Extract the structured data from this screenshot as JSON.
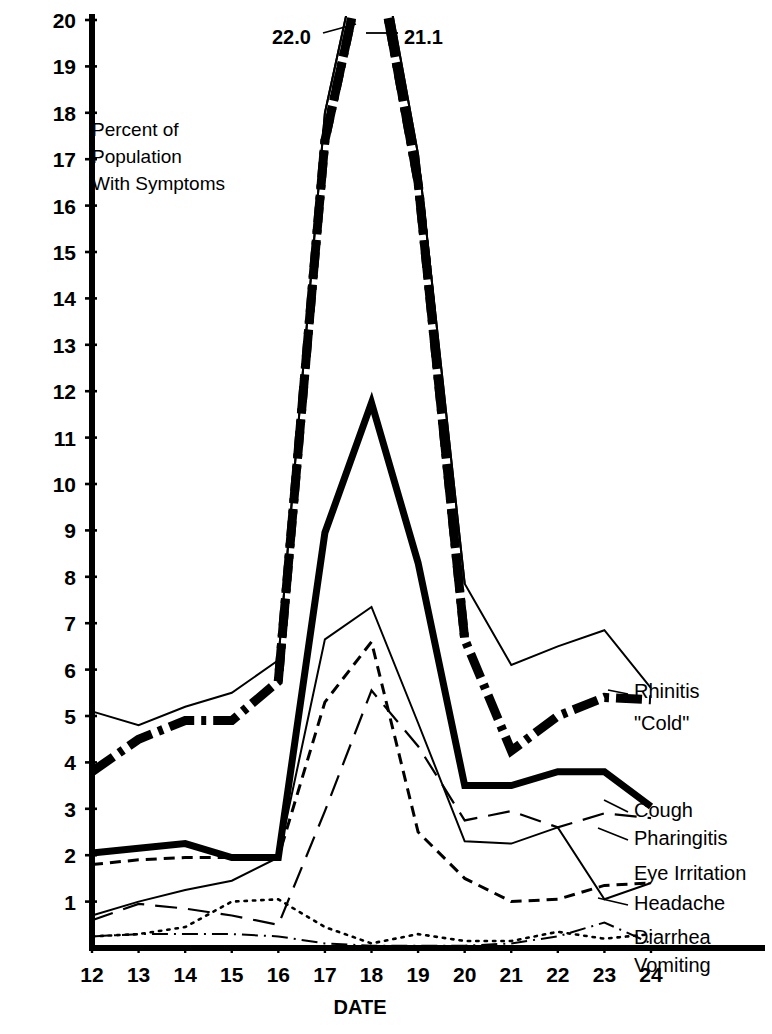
{
  "chart_data": {
    "type": "line",
    "title": "",
    "ylabel": "Percent of Population With Symptoms",
    "xlabel": "DATE",
    "x": [
      12,
      13,
      14,
      15,
      16,
      17,
      18,
      19,
      20,
      21,
      22,
      23,
      24
    ],
    "categories": [
      "12",
      "13",
      "14",
      "15",
      "16",
      "17",
      "18",
      "19",
      "20",
      "21",
      "22",
      "23",
      "24"
    ],
    "xlim": [
      12,
      24
    ],
    "ylim": [
      0,
      20
    ],
    "yticks": [
      1,
      2,
      3,
      4,
      5,
      6,
      7,
      8,
      9,
      10,
      11,
      12,
      13,
      14,
      15,
      16,
      17,
      18,
      19,
      20
    ],
    "grid": false,
    "legend_position": "right-inline",
    "annotations": [
      {
        "text": "22.0",
        "series": "Rhinitis \"Cold\"",
        "x": 18,
        "value": 22.0
      },
      {
        "text": "21.1",
        "series": "Cough",
        "x": 18,
        "value": 21.1
      }
    ],
    "series": [
      {
        "name": "Rhinitis \"Cold\"",
        "label": "Rhinitis",
        "label2": "\"Cold\"",
        "style": "thick-dash-dot",
        "values": [
          3.8,
          4.5,
          4.9,
          4.9,
          5.75,
          17.4,
          22.0,
          16.5,
          6.65,
          4.25,
          5.0,
          5.4,
          5.35
        ]
      },
      {
        "name": "Cough",
        "label": "Cough",
        "style": "thick-solid",
        "values": [
          2.05,
          2.15,
          2.25,
          1.95,
          1.95,
          8.95,
          11.75,
          8.3,
          3.5,
          3.5,
          3.8,
          3.8,
          3.05
        ]
      },
      {
        "name": "Eye Irritation",
        "label": "Eye Irritation",
        "style": "thin-solid",
        "values": [
          0.7,
          1.0,
          1.25,
          1.45,
          1.95,
          6.65,
          7.35,
          4.85,
          2.3,
          2.25,
          2.6,
          1.05,
          1.4
        ]
      },
      {
        "name": "Headache",
        "label": "Headache",
        "style": "dashed",
        "values": [
          1.8,
          1.9,
          1.95,
          1.95,
          1.95,
          5.3,
          6.6,
          2.5,
          1.5,
          1.0,
          1.05,
          1.35,
          1.4
        ]
      },
      {
        "name": "Pharingitis",
        "label": "Pharingitis",
        "style": "long-dash",
        "values": [
          0.6,
          0.95,
          0.85,
          0.7,
          0.5,
          2.95,
          5.55,
          4.35,
          2.75,
          2.95,
          2.6,
          2.9,
          2.8
        ]
      },
      {
        "name": "Diarrhea",
        "label": "Diarrhea",
        "style": "thin-dash-dot",
        "values": [
          0.25,
          0.3,
          0.3,
          0.3,
          0.25,
          0.1,
          0.05,
          0.05,
          0.05,
          0.1,
          0.25,
          0.55,
          0.1
        ]
      },
      {
        "name": "Vomiting",
        "label": "Vomiting",
        "style": "dotted",
        "values": [
          0.25,
          0.3,
          0.45,
          1.0,
          1.05,
          0.45,
          0.1,
          0.3,
          0.15,
          0.15,
          0.35,
          0.2,
          0.3
        ]
      }
    ],
    "peak_series": [
      {
        "name": "Rhinitis \"Cold\" peak",
        "style": "thick-dash-dot",
        "points": [
          [
            16,
            5.75
          ],
          [
            17,
            17.4
          ],
          [
            18,
            22.0
          ],
          [
            19,
            16.5
          ],
          [
            20,
            6.65
          ]
        ]
      },
      {
        "name": "Eye Irritation peak",
        "style": "thin-solid",
        "points": [
          [
            16,
            6.2
          ],
          [
            17,
            18.0
          ],
          [
            18,
            22.6
          ],
          [
            19,
            17.1
          ],
          [
            20,
            7.85
          ]
        ]
      }
    ],
    "series_secondary_thin": {
      "name": "thin-overlay",
      "comment_values": [
        5.1,
        4.8,
        5.2,
        5.5,
        6.2,
        18.0,
        22.6,
        17.1,
        7.85,
        6.1,
        6.5,
        6.85,
        5.6
      ]
    }
  },
  "ytick_labels": [
    "20",
    "19",
    "18",
    "17",
    "16",
    "15",
    "14",
    "13",
    "12",
    "11",
    "10",
    "9",
    "8",
    "7",
    "6",
    "5",
    "4",
    "3",
    "2",
    "1"
  ],
  "axis": {
    "ylabel_lines": [
      "Percent of",
      "Population",
      "With Symptoms"
    ],
    "xlabel": "DATE"
  }
}
